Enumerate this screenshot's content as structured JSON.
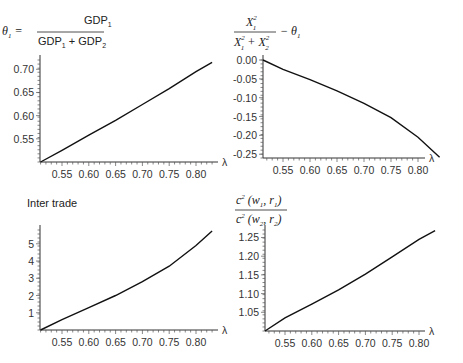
{
  "chart_data": [
    {
      "type": "line",
      "panel": "top-left",
      "title": "θ1 = GDP1 / (GDP1 + GDP2)",
      "title_parts": {
        "lhs": "θ",
        "lhs_sub": "1",
        "num": "GDP",
        "num_sub": "1",
        "den_a": "GDP",
        "den_a_sub": "1",
        "den_b": "GDP",
        "den_b_sub": "2"
      },
      "xlabel": "λ",
      "ylabel": "",
      "x_ticks": [
        "0.55",
        "0.60",
        "0.65",
        "0.70",
        "0.75",
        "0.80"
      ],
      "y_ticks": [
        "0.55",
        "0.60",
        "0.65",
        "0.70"
      ],
      "xlim": [
        0.51,
        0.83
      ],
      "ylim": [
        0.5,
        0.72
      ],
      "x": [
        0.51,
        0.55,
        0.6,
        0.65,
        0.7,
        0.75,
        0.8,
        0.83
      ],
      "values": [
        0.5,
        0.525,
        0.558,
        0.59,
        0.624,
        0.658,
        0.695,
        0.715
      ]
    },
    {
      "type": "line",
      "panel": "top-right",
      "title": "X1^2 / (X1^2 + X2^2) − θ1",
      "title_parts": {
        "num": "X",
        "num_sup": "2",
        "num_sub": "1",
        "den_a": "X",
        "den_a_sup": "2",
        "den_a_sub": "1",
        "den_b": "X",
        "den_b_sup": "2",
        "den_b_sub": "2",
        "minus": "− θ",
        "minus_sub": "1"
      },
      "xlabel": "λ",
      "ylabel": "",
      "x_ticks": [
        "0.55",
        "0.60",
        "0.65",
        "0.70",
        "0.75",
        "0.80"
      ],
      "y_ticks": [
        "0.00",
        "-0.05",
        "-0.10",
        "-0.15",
        "-0.20",
        "-0.25"
      ],
      "xlim": [
        0.51,
        0.84
      ],
      "ylim": [
        -0.26,
        0.0
      ],
      "x": [
        0.51,
        0.55,
        0.6,
        0.65,
        0.7,
        0.75,
        0.8,
        0.84
      ],
      "values": [
        0.0,
        -0.025,
        -0.052,
        -0.082,
        -0.115,
        -0.153,
        -0.205,
        -0.258
      ]
    },
    {
      "type": "line",
      "panel": "bottom-left",
      "title": "Inter trade",
      "xlabel": "λ",
      "ylabel": "",
      "x_ticks": [
        "0.55",
        "0.60",
        "0.65",
        "0.70",
        "0.75",
        "0.80"
      ],
      "y_ticks": [
        "1",
        "2",
        "3",
        "4",
        "5"
      ],
      "xlim": [
        0.51,
        0.83
      ],
      "ylim": [
        0,
        5.8
      ],
      "x": [
        0.51,
        0.55,
        0.6,
        0.65,
        0.7,
        0.75,
        0.8,
        0.83
      ],
      "values": [
        0.0,
        0.6,
        1.3,
        2.0,
        2.8,
        3.7,
        4.9,
        5.75
      ]
    },
    {
      "type": "line",
      "panel": "bottom-right",
      "title": "c^2(w1, r1) / c^2(w2, r2)",
      "title_parts": {
        "num": "c",
        "num_sup": "2",
        "num_args": "(w",
        "num_args_sub": "1",
        "num_args_b": ", r",
        "num_args_b_sub": "1",
        "den": "c",
        "den_sup": "2",
        "den_args": "(w",
        "den_args_sub": "2",
        "den_args_b": ", r",
        "den_args_b_sub": "2"
      },
      "xlabel": "λ",
      "ylabel": "",
      "x_ticks": [
        "0.55",
        "0.60",
        "0.65",
        "0.70",
        "0.75",
        "0.80"
      ],
      "y_ticks": [
        "1.05",
        "1.10",
        "1.15",
        "1.20",
        "1.25"
      ],
      "xlim": [
        0.51,
        0.83
      ],
      "ylim": [
        1.0,
        1.27
      ],
      "x": [
        0.51,
        0.55,
        0.6,
        0.65,
        0.7,
        0.75,
        0.8,
        0.83
      ],
      "values": [
        1.0,
        1.035,
        1.072,
        1.11,
        1.152,
        1.198,
        1.245,
        1.268
      ]
    }
  ]
}
